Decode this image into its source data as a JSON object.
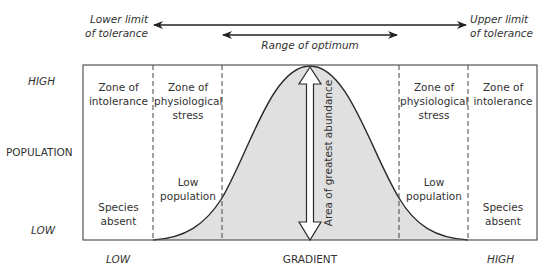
{
  "tolerance": {
    "lower_limit_line1": "Lower limit",
    "lower_limit_line2": "of tolerance",
    "upper_limit_line1": "Upper limit",
    "upper_limit_line2": "of tolerance",
    "optimum_range": "Range of optimum"
  },
  "y_axis": {
    "label": "POPULATION",
    "high": "HIGH",
    "low": "LOW"
  },
  "x_axis": {
    "label": "GRADIENT",
    "low": "LOW",
    "high": "HIGH"
  },
  "zones": {
    "left_intolerance": {
      "title_line1": "Zone of",
      "title_line2": "intolerance",
      "note_line1": "Species",
      "note_line2": "absent"
    },
    "left_stress": {
      "title_line1": "Zone of",
      "title_line2": "physiological",
      "title_line3": "stress",
      "note_line1": "Low",
      "note_line2": "population"
    },
    "center": {
      "label": "Area of greatest abundance"
    },
    "right_stress": {
      "title_line1": "Zone of",
      "title_line2": "physiological",
      "title_line3": "stress",
      "note_line1": "Low",
      "note_line2": "population"
    },
    "right_intolerance": {
      "title_line1": "Zone of",
      "title_line2": "intolerance",
      "note_line1": "Species",
      "note_line2": "absent"
    }
  },
  "colors": {
    "curve_fill": "#e0e0e0",
    "lines": "#333333"
  }
}
